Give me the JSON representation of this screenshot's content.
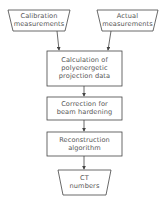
{
  "diagram": {
    "inputs": [
      {
        "line1": "Calibration",
        "line2": "measurements"
      },
      {
        "line1": "Actual",
        "line2": "measurements"
      }
    ],
    "steps": [
      {
        "line1": "Calculation of",
        "line2": "polyenergetic",
        "line3": "projection data"
      },
      {
        "line1": "Correction for",
        "line2": "beam hardening"
      },
      {
        "line1": "Reconstruction",
        "line2": "algorithm"
      }
    ],
    "output": {
      "line1": "CT",
      "line2": "numbers"
    },
    "colors": {
      "stroke": "#444444",
      "text": "#555555",
      "background": "#ffffff"
    }
  }
}
